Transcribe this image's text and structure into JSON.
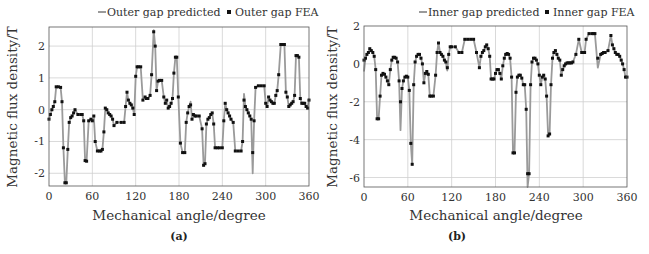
{
  "chart_data": [
    {
      "type": "line",
      "panel": "(a)",
      "title": "",
      "xlabel": "Mechanical angle/degree",
      "ylabel": "Magnetic flux density/T",
      "xlim": [
        0,
        360
      ],
      "ylim": [
        -2.4,
        2.6
      ],
      "xticks": [
        0,
        60,
        120,
        180,
        240,
        300,
        360
      ],
      "yticks": [
        -2,
        -1,
        0,
        1,
        2
      ],
      "grid": true,
      "legend": {
        "position": "top-right-outside",
        "entries": [
          "Outer gap predicted",
          "Outer gap FEA"
        ]
      },
      "x": [
        0,
        2,
        4,
        6,
        8,
        10,
        13,
        16,
        18,
        20,
        22,
        24,
        26,
        28,
        30,
        32,
        34,
        36,
        40,
        44,
        46,
        48,
        50,
        52,
        55,
        58,
        60,
        62,
        64,
        67,
        70,
        72,
        74,
        76,
        78,
        80,
        82,
        84,
        86,
        88,
        90,
        94,
        100,
        104,
        106,
        108,
        110,
        112,
        114,
        116,
        118,
        120,
        122,
        124,
        127,
        130,
        133,
        135,
        137,
        140,
        142,
        145,
        147,
        149,
        151,
        153,
        156,
        159,
        161,
        163,
        165,
        167,
        169,
        171,
        173,
        175,
        177,
        179,
        182,
        185,
        188,
        190,
        192,
        194,
        196,
        198,
        200,
        202,
        204,
        208,
        212,
        214,
        216,
        218,
        220,
        222,
        224,
        226,
        228,
        230,
        233,
        236,
        240,
        242,
        244,
        246,
        248,
        250,
        252,
        255,
        258,
        262,
        266,
        268,
        270,
        272,
        274,
        276,
        278,
        280,
        282,
        284,
        286,
        290,
        294,
        298,
        300,
        302,
        304,
        306,
        308,
        310,
        312,
        314,
        316,
        318,
        321,
        324,
        326,
        328,
        330,
        332,
        334,
        336,
        338,
        340,
        342,
        344,
        346,
        348,
        350,
        352,
        354,
        356,
        358,
        360
      ],
      "series": [
        {
          "name": "Outer gap predicted",
          "style": "line",
          "color": "#9a9a9a",
          "values": [
            -0.3,
            -0.15,
            0.0,
            0.1,
            0.25,
            0.72,
            0.72,
            0.7,
            0.25,
            -1.2,
            -2.3,
            -2.3,
            -1.25,
            -0.4,
            -0.25,
            -0.2,
            -0.1,
            0.0,
            -0.15,
            -0.15,
            -0.15,
            -0.35,
            -1.6,
            -1.62,
            -0.35,
            -0.3,
            -0.35,
            -0.2,
            -1.0,
            -1.3,
            -1.3,
            -1.3,
            -1.25,
            -0.7,
            0.05,
            0.0,
            -0.1,
            -0.15,
            -0.2,
            -0.3,
            -0.5,
            -0.4,
            -0.4,
            -0.4,
            0.1,
            0.55,
            0.3,
            0.2,
            0.15,
            0.05,
            -0.15,
            1.05,
            1.35,
            1.35,
            1.35,
            0.3,
            0.4,
            0.35,
            0.35,
            0.45,
            1.1,
            2.5,
            2.0,
            0.6,
            0.9,
            0.92,
            0.92,
            0.4,
            0.2,
            0.3,
            0.05,
            0.1,
            0.2,
            0.35,
            1.15,
            1.65,
            1.65,
            0.4,
            -1.05,
            -1.35,
            -1.35,
            -0.4,
            -0.1,
            0.1,
            0.25,
            -0.3,
            -0.15,
            -0.2,
            -0.2,
            -0.2,
            -0.6,
            -1.75,
            -1.7,
            -0.45,
            -0.3,
            -0.25,
            -0.15,
            -0.1,
            -0.45,
            -1.2,
            -1.2,
            -1.2,
            -1.2,
            -0.35,
            0.2,
            0.0,
            -0.1,
            -0.2,
            -0.3,
            -0.4,
            -1.3,
            -1.3,
            -1.3,
            -1.0,
            0.5,
            0.1,
            0.0,
            -0.1,
            -0.2,
            -0.3,
            -2.0,
            -0.35,
            0.7,
            0.75,
            0.75,
            0.75,
            0.2,
            0.1,
            0.4,
            0.3,
            0.25,
            0.2,
            0.2,
            0.45,
            0.6,
            1.1,
            2.05,
            2.05,
            2.05,
            0.55,
            0.4,
            0.1,
            0.15,
            0.2,
            0.25,
            0.45,
            1.7,
            1.7,
            1.65,
            0.35,
            0.2,
            0.2,
            0.2,
            0.1,
            0.05,
            0.35,
            0.1
          ]
        },
        {
          "name": "Outer gap FEA",
          "style": "square-marker",
          "color": "#111111",
          "values": [
            -0.3,
            -0.15,
            0.0,
            0.1,
            0.25,
            0.72,
            0.72,
            0.7,
            0.25,
            -1.2,
            -2.3,
            -2.3,
            -1.25,
            -0.4,
            -0.25,
            -0.2,
            -0.1,
            0.0,
            -0.15,
            -0.15,
            -0.15,
            -0.35,
            -1.6,
            -1.62,
            -0.35,
            -0.3,
            -0.35,
            -0.2,
            -1.0,
            -1.3,
            -1.3,
            -1.3,
            -1.25,
            -0.7,
            0.05,
            0.0,
            -0.1,
            -0.15,
            -0.2,
            -0.3,
            -0.5,
            -0.4,
            -0.4,
            -0.4,
            0.1,
            0.55,
            0.3,
            0.2,
            0.15,
            0.05,
            -0.15,
            1.05,
            1.35,
            1.35,
            1.35,
            0.3,
            0.4,
            0.35,
            0.35,
            0.45,
            1.1,
            2.45,
            2.0,
            0.6,
            0.9,
            0.92,
            0.92,
            0.4,
            0.2,
            0.3,
            0.05,
            0.1,
            0.2,
            0.35,
            1.15,
            1.65,
            1.65,
            0.4,
            -1.05,
            -1.35,
            -1.35,
            -0.4,
            -0.1,
            0.1,
            0.15,
            -0.3,
            -0.15,
            -0.2,
            -0.2,
            -0.2,
            -0.6,
            -1.75,
            -1.7,
            -0.45,
            -0.3,
            -0.25,
            -0.15,
            -0.1,
            -0.45,
            -1.2,
            -1.2,
            -1.2,
            -1.2,
            -0.35,
            0.2,
            0.0,
            -0.1,
            -0.2,
            -0.3,
            -0.4,
            -1.3,
            -1.3,
            -1.3,
            -1.0,
            0.3,
            0.1,
            0.0,
            -0.1,
            -0.2,
            -0.3,
            -1.35,
            -0.35,
            0.7,
            0.75,
            0.75,
            0.75,
            0.2,
            0.1,
            0.4,
            0.3,
            0.25,
            0.2,
            0.2,
            0.45,
            0.6,
            1.1,
            2.05,
            2.05,
            2.05,
            0.55,
            0.4,
            0.1,
            0.15,
            0.2,
            0.25,
            0.45,
            1.7,
            1.7,
            1.65,
            0.35,
            0.2,
            0.2,
            0.2,
            0.1,
            0.05,
            0.3,
            0.1
          ]
        }
      ]
    },
    {
      "type": "line",
      "panel": "(b)",
      "title": "",
      "xlabel": "Mechanical angle/degree",
      "ylabel": "Magnetic flux density/T",
      "xlim": [
        0,
        360
      ],
      "ylim": [
        -6.5,
        2
      ],
      "xticks": [
        0,
        60,
        120,
        180,
        240,
        300,
        360
      ],
      "yticks": [
        -6,
        -4,
        -2,
        0,
        2
      ],
      "grid": true,
      "legend": {
        "position": "top-right-outside",
        "entries": [
          "Inner gap predicted",
          "Inner gap FEA"
        ]
      },
      "x": [
        0,
        2,
        4,
        6,
        8,
        10,
        12,
        14,
        16,
        18,
        20,
        22,
        24,
        26,
        28,
        30,
        32,
        34,
        36,
        38,
        40,
        42,
        44,
        46,
        48,
        50,
        52,
        54,
        56,
        58,
        60,
        62,
        64,
        66,
        68,
        70,
        72,
        74,
        76,
        78,
        80,
        82,
        84,
        86,
        88,
        90,
        92,
        95,
        98,
        100,
        102,
        104,
        106,
        108,
        110,
        112,
        114,
        116,
        118,
        120,
        125,
        130,
        134,
        138,
        142,
        146,
        150,
        154,
        158,
        160,
        162,
        164,
        166,
        168,
        170,
        172,
        174,
        176,
        178,
        180,
        182,
        184,
        186,
        188,
        190,
        192,
        194,
        196,
        198,
        200,
        202,
        204,
        206,
        208,
        210,
        212,
        214,
        216,
        218,
        220,
        222,
        224,
        226,
        228,
        230,
        232,
        234,
        236,
        238,
        240,
        242,
        244,
        246,
        248,
        250,
        252,
        254,
        256,
        258,
        260,
        262,
        264,
        266,
        268,
        270,
        272,
        274,
        276,
        278,
        280,
        282,
        284,
        286,
        290,
        294,
        298,
        300,
        302,
        304,
        308,
        312,
        314,
        316,
        320,
        324,
        326,
        328,
        330,
        334,
        338,
        340,
        342,
        344,
        346,
        348,
        350,
        352,
        354,
        356,
        358,
        360
      ],
      "series": [
        {
          "name": "Inner gap predicted",
          "style": "line",
          "color": "#9a9a9a",
          "values": [
            -0.4,
            0.3,
            0.5,
            0.6,
            0.8,
            0.7,
            0.6,
            0.4,
            -0.3,
            -2.9,
            -2.9,
            -1.7,
            -0.6,
            -0.5,
            -0.55,
            -0.7,
            -0.9,
            -1.1,
            -0.3,
            0.2,
            0.35,
            0.35,
            0.3,
            0.1,
            -0.9,
            -3.5,
            -1.3,
            -0.9,
            -0.7,
            -0.65,
            -0.7,
            -1.4,
            -4.2,
            -5.3,
            -1.1,
            0.1,
            0.4,
            0.5,
            0.5,
            0.3,
            0.0,
            -1.0,
            -0.5,
            -0.4,
            -0.55,
            -1.7,
            -1.7,
            -1.7,
            -0.6,
            0.6,
            1.1,
            0.6,
            0.5,
            0.4,
            0.2,
            0.1,
            -0.35,
            0.5,
            0.9,
            0.9,
            0.9,
            0.6,
            0.6,
            1.3,
            1.3,
            1.3,
            1.3,
            0.6,
            -0.2,
            0.4,
            0.6,
            0.7,
            0.9,
            1.0,
            0.8,
            0.4,
            -0.8,
            -0.8,
            -0.8,
            -0.5,
            -0.3,
            -0.3,
            -0.5,
            -0.8,
            -0.1,
            0.3,
            0.5,
            0.55,
            0.5,
            0.3,
            -0.7,
            -4.7,
            -4.7,
            -1.5,
            -0.7,
            -0.6,
            -0.6,
            -0.75,
            -1.1,
            -1.1,
            -2.4,
            -6.5,
            -5.8,
            -1.1,
            0.1,
            0.3,
            0.3,
            0.2,
            0.0,
            -0.6,
            -1.1,
            -0.7,
            -0.6,
            -0.8,
            -1.7,
            -3.8,
            -3.7,
            -1.1,
            0.3,
            0.6,
            0.7,
            0.5,
            0.3,
            0.2,
            -0.6,
            -0.3,
            -0.1,
            0.0,
            0.05,
            0.05,
            0.05,
            0.05,
            0.1,
            0.5,
            1.3,
            0.6,
            0.6,
            0.6,
            1.3,
            1.6,
            1.6,
            1.6,
            1.6,
            -0.2,
            0.5,
            0.55,
            0.6,
            0.6,
            0.7,
            1.5,
            1.0,
            0.8,
            0.6,
            0.5,
            0.5,
            0.4,
            0.2,
            0.0,
            -0.3,
            -0.7,
            -0.7
          ]
        },
        {
          "name": "Inner gap FEA",
          "style": "square-marker",
          "color": "#111111",
          "values": [
            0.2,
            0.3,
            0.5,
            0.6,
            0.8,
            0.7,
            0.6,
            0.4,
            -0.3,
            -2.9,
            -2.9,
            -1.7,
            -0.6,
            -0.5,
            -0.55,
            -0.7,
            -0.9,
            -1.1,
            -0.3,
            0.2,
            0.35,
            0.35,
            0.3,
            0.1,
            -0.9,
            -2.0,
            -1.3,
            -0.9,
            -0.7,
            -0.65,
            -0.7,
            -1.4,
            -4.2,
            -5.3,
            -1.1,
            0.1,
            0.4,
            0.5,
            0.5,
            0.3,
            0.0,
            -1.0,
            -0.5,
            -0.4,
            -0.55,
            -1.7,
            -1.7,
            -1.7,
            -0.6,
            0.6,
            1.1,
            0.6,
            0.5,
            0.4,
            0.2,
            0.1,
            -0.2,
            0.5,
            0.9,
            0.9,
            0.9,
            0.6,
            0.6,
            1.3,
            1.3,
            1.3,
            1.3,
            0.6,
            -0.2,
            0.4,
            0.6,
            0.7,
            0.9,
            1.0,
            0.8,
            0.4,
            -0.8,
            -0.8,
            -0.8,
            -0.5,
            -0.3,
            -0.3,
            -0.5,
            -0.8,
            -0.1,
            0.3,
            0.5,
            0.55,
            0.5,
            0.3,
            -0.7,
            -4.7,
            -4.7,
            -1.5,
            -0.7,
            -0.6,
            -0.6,
            -0.75,
            -1.1,
            -1.1,
            -2.4,
            -5.8,
            -5.8,
            -1.1,
            0.1,
            0.3,
            0.3,
            0.2,
            0.0,
            -0.6,
            -1.1,
            -0.7,
            -0.6,
            -0.8,
            -1.7,
            -3.8,
            -3.7,
            -1.1,
            0.3,
            0.6,
            0.7,
            0.5,
            0.3,
            0.2,
            -0.6,
            -0.3,
            -0.1,
            0.0,
            0.05,
            0.05,
            0.05,
            0.05,
            0.1,
            0.5,
            1.3,
            0.6,
            0.6,
            0.6,
            1.3,
            1.6,
            1.6,
            1.6,
            1.6,
            0.3,
            0.5,
            0.55,
            0.6,
            0.6,
            0.7,
            1.5,
            1.0,
            0.8,
            0.6,
            0.5,
            0.5,
            0.4,
            0.2,
            0.0,
            -0.3,
            -0.7,
            -0.7
          ]
        }
      ]
    }
  ],
  "panels": {
    "a": {
      "caption": "(a)",
      "xlabel": "Mechanical angle/degree",
      "ylabel": "Magnetic flux density/T",
      "legend_line": "Outer gap predicted",
      "legend_marker": "Outer gap FEA",
      "xticks": [
        "0",
        "60",
        "120",
        "180",
        "240",
        "300",
        "360"
      ],
      "yticks": [
        "2",
        "1",
        "0",
        "-1",
        "-2"
      ]
    },
    "b": {
      "caption": "(b)",
      "xlabel": "Mechanical angle/degree",
      "ylabel": "Magnetic flux density/T",
      "legend_line": "Inner gap predicted",
      "legend_marker": "Inner gap FEA",
      "xticks": [
        "0",
        "60",
        "120",
        "180",
        "240",
        "300",
        "360"
      ],
      "yticks": [
        "2",
        "0",
        "-2",
        "-4",
        "-6"
      ]
    }
  },
  "colors": {
    "line": "#9a9a9a",
    "marker": "#111111",
    "grid": "#cfcfcf",
    "axis": "#444444"
  }
}
